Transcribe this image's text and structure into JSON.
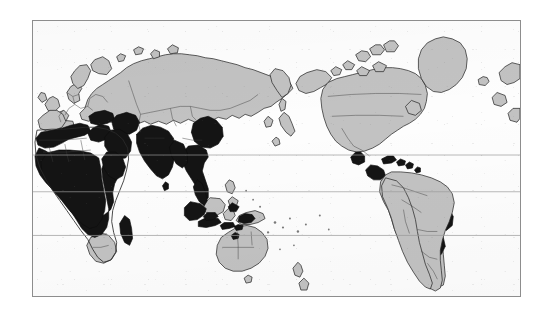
{
  "figure": {
    "type": "thematic-world-map",
    "projection_note": "Pacific-centred equirectangular world map",
    "title": "",
    "caption": "",
    "axis_labels": [],
    "tick_labels": [],
    "legend": {
      "present": false,
      "entries": [
        {
          "key": "highlighted",
          "label": "",
          "color": "#141414"
        },
        {
          "key": "other-land",
          "label": "",
          "color": "#c2c2c2"
        },
        {
          "key": "ocean",
          "label": "",
          "color": "#fdfdfd"
        }
      ]
    },
    "frame": {
      "border_color": "#8d8d8d",
      "x": 32,
      "y": 20,
      "width": 489,
      "height": 277
    },
    "graticule": {
      "line_color": "#9a9a9a",
      "horizontal_lines_y": [
        135,
        172,
        216
      ],
      "vertical_lines_x": []
    },
    "colors": {
      "background": "#ffffff",
      "ocean": "#fdfdfd",
      "land": "#c2c2c2",
      "highlight": "#141414",
      "coastline": "#2a2a2a",
      "internal_border": "#3a3a3a"
    },
    "regions_highlighted": [
      "North Africa / Maghreb coast",
      "Sub-Saharan Africa",
      "Madagascar",
      "Turkey and the Middle East",
      "Arabian Peninsula",
      "Indian subcontinent",
      "Mainland Southeast Asia",
      "Southern China",
      "Indonesia",
      "Philippines (partial)",
      "Papua New Guinea",
      "Mexico (southern)",
      "Central America",
      "Caribbean",
      "Colombia / Venezuela",
      "Northeastern Brazil",
      "Southern Brazil / Paraguay"
    ],
    "regions_plain": [
      "Europe",
      "Russia and Northern Asia",
      "Japan and Korea",
      "Canada",
      "United States",
      "Greenland",
      "Australia",
      "New Zealand",
      "Southern Africa",
      "Argentina and Chile"
    ]
  }
}
